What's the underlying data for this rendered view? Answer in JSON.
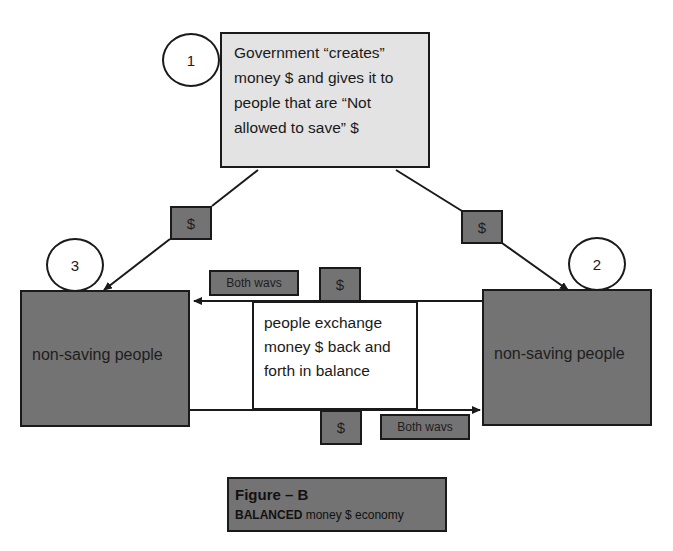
{
  "diagram": {
    "government_box": {
      "step": "1",
      "lines": [
        "Government “creates”",
        "money $ and gives it to",
        "people that are “Not",
        "allowed to save” $"
      ]
    },
    "left_group": {
      "step": "3",
      "label": "non-saving people"
    },
    "right_group": {
      "step": "2",
      "label": "non-saving people"
    },
    "exchange_box": {
      "lines": [
        "people exchange",
        "money $ back and",
        "forth in balance"
      ]
    },
    "flow_labels": {
      "dollar": "$",
      "both_ways_top": "Both wavs",
      "both_ways_bottom": "Both wavs"
    },
    "caption": {
      "title": "Figure – B",
      "subtitle_bold": "BALANCED",
      "subtitle_rest": " money $ economy"
    },
    "colors": {
      "dark_box": "#737373",
      "light_box": "#e3e3e3",
      "stroke": "#1a1a1a"
    }
  }
}
